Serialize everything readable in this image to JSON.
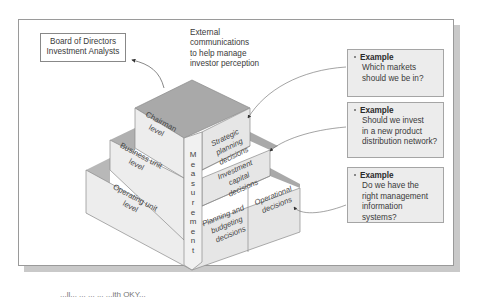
{
  "diagram": {
    "title_box": {
      "line1": "Board of Directors",
      "line2": "Investment Analysts"
    },
    "external_note": {
      "line1": "External",
      "line2": "communications",
      "line3": "to help manage",
      "line4": "investor perception"
    },
    "levels": [
      {
        "line1": "Chairman",
        "line2": "level"
      },
      {
        "line1": "Business unit",
        "line2": "level"
      },
      {
        "line1": "Operating unit",
        "line2": "level"
      }
    ],
    "measurement_label": "Measurement",
    "decisions": [
      {
        "line1": "Strategic",
        "line2": "planning",
        "line3": "decisions"
      },
      {
        "line1": "Investment",
        "line2": "capital",
        "line3": "decisions"
      },
      {
        "line1": "Planning and",
        "line2": "budgeting",
        "line3": "decisions"
      },
      {
        "line1": "Operational",
        "line2": "decisions"
      }
    ],
    "examples": [
      {
        "title": "Example",
        "line1": "Which markets",
        "line2": "should we be in?"
      },
      {
        "title": "Example",
        "line1": "Should we invest",
        "line2": "in a new product",
        "line3": "distribution network?"
      },
      {
        "title": "Example",
        "line1": "Do we have the",
        "line2": "right management",
        "line3": "information systems?"
      }
    ],
    "colors": {
      "top_face": "#a9a9a9",
      "front_face": "#ededed",
      "side_face": "#e2e2e2",
      "example_bg": "#ececec",
      "frame_shadow": "#c9c9c9"
    }
  },
  "caption": "...ll... ... ... ... ...ith OKY..."
}
